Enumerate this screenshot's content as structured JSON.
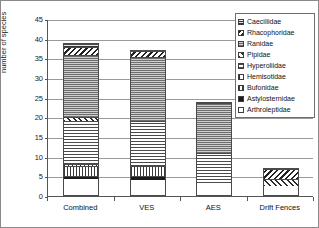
{
  "chart_data": {
    "type": "bar",
    "title": "",
    "xlabel": "",
    "ylabel": "number of species",
    "ylim": [
      0,
      45
    ],
    "ytick_step": 5,
    "yticks": [
      0,
      5,
      10,
      15,
      20,
      25,
      30,
      35,
      40,
      45
    ],
    "grid": true,
    "stacked": true,
    "legend_position": "top-right",
    "categories": [
      "Combined",
      "VES",
      "AES",
      "Drift Fences"
    ],
    "series": [
      {
        "name": "Arthroleptidae",
        "values": [
          4,
          4,
          3,
          2.5
        ],
        "pattern": "solid-white"
      },
      {
        "name": "Astylosternidae",
        "values": [
          1,
          1,
          0,
          0
        ],
        "pattern": "solid-black"
      },
      {
        "name": "Bufonidae",
        "values": [
          2.5,
          2.5,
          0,
          0
        ],
        "pattern": "vertical-lines"
      },
      {
        "name": "Hemisotidae",
        "values": [
          0.5,
          0,
          0,
          0
        ],
        "pattern": "fine-grid"
      },
      {
        "name": "Hyperoliidae",
        "values": [
          11,
          11.5,
          8,
          0
        ],
        "pattern": "horizontal-lines"
      },
      {
        "name": "Pipidae",
        "values": [
          1,
          0,
          0,
          2
        ],
        "pattern": "diagonal-hatch-right"
      },
      {
        "name": "Ranidae",
        "values": [
          16,
          16.5,
          13,
          0
        ],
        "pattern": "dotted-gray"
      },
      {
        "name": "Rhacophoridae",
        "values": [
          2,
          1.5,
          0,
          2.5
        ],
        "pattern": "diagonal-hatch-left"
      },
      {
        "name": "Caeciliidae",
        "values": [
          1,
          0,
          0,
          0
        ],
        "pattern": "dark-checker"
      }
    ],
    "totals": [
      39,
      37,
      24,
      7
    ]
  },
  "legend": {
    "entries": [
      "Caeciliidae",
      "Rhacophoridae",
      "Ranidae",
      "Pipidae",
      "Hyperoliidae",
      "Hemisotidae",
      "Bufonidae",
      "Astylosternidae",
      "Arthroleptidae"
    ]
  }
}
